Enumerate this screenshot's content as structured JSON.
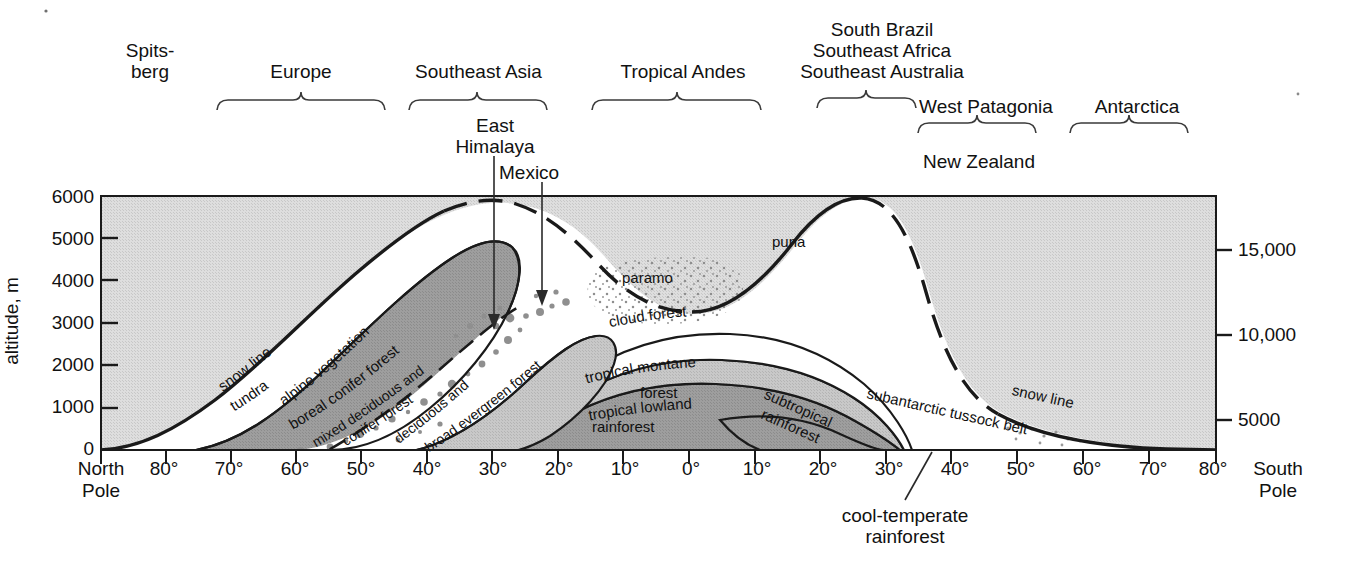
{
  "figure": {
    "type": "diagram"
  },
  "axes": {
    "left": {
      "title": "altitude, m",
      "ticks": [
        "6000",
        "5000",
        "4000",
        "3000",
        "2000",
        "1000",
        "0"
      ],
      "values_m": [
        6000,
        5000,
        4000,
        3000,
        2000,
        1000,
        0
      ],
      "range_m": [
        0,
        6000
      ]
    },
    "right": {
      "title": "altitude, ft",
      "ticks": [
        "15,000",
        "10,000",
        "5000"
      ],
      "values_ft": [
        15000,
        10000,
        5000
      ]
    },
    "bottom": {
      "left_cap": "North\nPole",
      "left_cap_line1": "North",
      "left_cap_line2": "Pole",
      "right_cap_line1": "South",
      "right_cap_line2": "Pole",
      "ticks": [
        "80°",
        "70°",
        "60°",
        "50°",
        "40°",
        "30°",
        "20°",
        "10°",
        "0°",
        "10°",
        "20°",
        "30°",
        "40°",
        "50°",
        "60°",
        "70°",
        "80°"
      ],
      "hemisphere_order": [
        "N",
        "N",
        "N",
        "N",
        "N",
        "N",
        "N",
        "N",
        "equator",
        "S",
        "S",
        "S",
        "S",
        "S",
        "S",
        "S",
        "S"
      ]
    }
  },
  "regions": [
    {
      "name": "Spits-berg",
      "line1": "Spits-",
      "line2": "berg",
      "bracket": false
    },
    {
      "name": "Europe",
      "line1": "Europe",
      "line2": "",
      "bracket": true
    },
    {
      "name": "Southeast Asia",
      "line1": "Southeast Asia",
      "line2": "",
      "bracket": true
    },
    {
      "name": "Tropical Andes",
      "line1": "Tropical Andes",
      "line2": "",
      "bracket": true
    },
    {
      "name": "South Brazil / Southeast Africa / Southeast Australia",
      "line1": "South Brazil",
      "line2": "Southeast Africa",
      "line3": "Southeast Australia",
      "bracket": true
    },
    {
      "name": "West Patagonia",
      "line1": "West Patagonia",
      "line2": "",
      "bracket": true
    },
    {
      "name": "Antarctica",
      "line1": "Antarctica",
      "line2": "",
      "bracket": true
    }
  ],
  "annotations": {
    "east_himalaya_line1": "East",
    "east_himalaya_line2": "Himalaya",
    "mexico": "Mexico",
    "new_zealand": "New Zealand",
    "cool_temperate_line1": "cool-temperate",
    "cool_temperate_line2": "rainforest"
  },
  "zones": {
    "snow_line_left": "snow line",
    "snow_line_right": "snow line",
    "tundra": "tundra",
    "alpine_vegetation": "alpine vegetation",
    "boreal_conifer_forest": "boreal conifer forest",
    "mixed_deciduous_and": "mixed deciduous and",
    "conifer_forest": "conifer forest",
    "deciduous_and": "deciduous and",
    "broad_evergreen_forest": "broad evergreen forest",
    "paramo": "paramo",
    "puna": "puna",
    "cloud_forest": "cloud forest",
    "tropical_montane_line1": "tropical montane",
    "tropical_montane_line2": "forest",
    "tropical_lowland_line1": "tropical lowland",
    "tropical_lowland_line2": "rainforest",
    "subtropical_line1": "subtropical",
    "subtropical_line2": "rainforest",
    "subantarctic_tussock_belt": "subantarctic tussock belt"
  },
  "colors": {
    "background": "#ffffff",
    "plot_fill_light_grey": "#d7d7d7",
    "band_mid_grey": "#c3c3c3",
    "band_dark_grey": "#9a9a9a",
    "band_white": "#ffffff",
    "stroke": "#1a1a1a",
    "text": "#111111",
    "stipple_dot": "#8f8f8f"
  }
}
